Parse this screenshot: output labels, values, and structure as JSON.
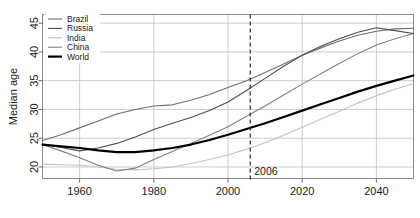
{
  "chart_data": {
    "type": "line",
    "title": "",
    "xlabel": "",
    "ylabel": "Median age",
    "xlim": [
      1950,
      2050
    ],
    "ylim": [
      18,
      46.5
    ],
    "xticks": [
      1960,
      1980,
      2000,
      2020,
      2040
    ],
    "xtick_labels": [
      "1960",
      "1980",
      "2000",
      "2020",
      "2040"
    ],
    "yticks": [
      20,
      25,
      30,
      35,
      40,
      45
    ],
    "ytick_labels": [
      "20",
      "25",
      "30",
      "35",
      "40",
      "45"
    ],
    "grid": true,
    "legend_position": "top-left",
    "annotations": [
      {
        "name": "marker-2006",
        "type": "vline",
        "x": 2006,
        "label": "2006",
        "style": "dashed"
      }
    ],
    "x": [
      1950,
      1955,
      1960,
      1965,
      1970,
      1975,
      1980,
      1985,
      1990,
      1995,
      2000,
      2005,
      2010,
      2015,
      2020,
      2025,
      2030,
      2035,
      2040,
      2045,
      2050
    ],
    "series": [
      {
        "name": "Brazil",
        "color": "#6e6e6e",
        "width": 1.1,
        "values": [
          24.6,
          25.6,
          26.8,
          28.0,
          29.2,
          30.0,
          30.6,
          30.8,
          31.6,
          32.6,
          33.8,
          35.0,
          36.4,
          37.9,
          39.4,
          40.7,
          41.9,
          42.9,
          43.6,
          44.0,
          44.1
        ]
      },
      {
        "name": "Russia",
        "color": "#4d4d4d",
        "width": 1.1,
        "values": [
          24.0,
          23.4,
          22.8,
          23.3,
          24.1,
          25.2,
          26.5,
          27.6,
          28.6,
          29.8,
          31.3,
          33.3,
          35.4,
          37.5,
          39.4,
          41.0,
          42.3,
          43.4,
          44.2,
          43.7,
          43.2
        ]
      },
      {
        "name": "India",
        "color": "#c2c2c2",
        "width": 1.1,
        "values": [
          20.5,
          20.4,
          20.3,
          20.0,
          19.6,
          19.5,
          19.7,
          20.0,
          20.6,
          21.3,
          22.1,
          23.1,
          24.2,
          25.5,
          26.9,
          28.3,
          29.7,
          31.1,
          32.4,
          33.5,
          34.5
        ]
      },
      {
        "name": "China",
        "color": "#808080",
        "width": 1.1,
        "values": [
          23.9,
          22.8,
          21.6,
          20.3,
          19.3,
          19.8,
          21.3,
          22.7,
          24.1,
          25.5,
          27.0,
          28.8,
          30.6,
          32.5,
          34.4,
          36.2,
          38.0,
          39.7,
          41.2,
          42.3,
          43.2
        ]
      },
      {
        "name": "World",
        "color": "#000000",
        "width": 2.2,
        "values": [
          23.9,
          23.6,
          23.3,
          22.9,
          22.6,
          22.6,
          22.9,
          23.3,
          23.9,
          24.7,
          25.6,
          26.6,
          27.6,
          28.7,
          29.8,
          30.9,
          32.0,
          33.1,
          34.1,
          35.0,
          35.9
        ]
      }
    ]
  },
  "legend": {
    "items": [
      {
        "label": "Brazil"
      },
      {
        "label": "Russia"
      },
      {
        "label": "India"
      },
      {
        "label": "China"
      },
      {
        "label": "World"
      }
    ]
  }
}
